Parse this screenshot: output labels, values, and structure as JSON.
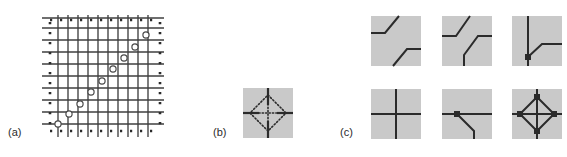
{
  "figure": {
    "type": "scientific-diagram",
    "caption_labels": {
      "a": "(a)",
      "b": "(b)",
      "c": "(c)"
    },
    "colors": {
      "background": "#ffffff",
      "tile_fill": "#c9c9c9",
      "line": "#2b2b2b",
      "grid_line": "#4a4a4a",
      "dot": "#2b2b2b",
      "circle_stroke": "#555555",
      "circle_fill": "#ffffff",
      "label_text": "#2b2b2b"
    }
  },
  "panel_a": {
    "label": "(a)",
    "description": "square lattice grid with dotted boundary and open circles along the main diagonal",
    "grid_columns": 10,
    "grid_rows": 10,
    "boundary_style": "dotted",
    "marker_count": 9,
    "marker_shape": "open-circle",
    "marker_positions": "staircase along the main diagonal from lower-left to upper-right"
  },
  "panel_b": {
    "label": "(b)",
    "description": "single lattice site: four line stubs meeting at a centre with a dotted diamond around the vertex",
    "tile_fill": "#c9c9c9",
    "stub_directions": [
      "up",
      "down",
      "left",
      "right"
    ],
    "inner_shape": "dotted-diamond"
  },
  "panel_c": {
    "label": "(c)",
    "tiles": [
      {
        "id": "tile-1",
        "row": 1,
        "col": 1,
        "description": "two parallel Z / stair shaped strands, no vertex dot",
        "dots": 0
      },
      {
        "id": "tile-2",
        "row": 1,
        "col": 2,
        "description": "upper strand from top bending to the right edge, lower strand from left edge bending down to bottom",
        "dots": 0
      },
      {
        "id": "tile-3",
        "row": 1,
        "col": 3,
        "description": "vertical line with a diagonal branch to the right edge, one vertex dot",
        "dots": 1
      },
      {
        "id": "tile-4",
        "row": 2,
        "col": 1,
        "description": "plain crossing of a vertical and a horizontal line, no vertex dot",
        "dots": 0
      },
      {
        "id": "tile-5",
        "row": 2,
        "col": 2,
        "description": "horizontal line with a diagonal branch going down to the bottom edge, one vertex dot",
        "dots": 1
      },
      {
        "id": "tile-6",
        "row": 2,
        "col": 3,
        "description": "diamond loop around the crossing with four vertex dots",
        "dots": 4
      }
    ]
  }
}
